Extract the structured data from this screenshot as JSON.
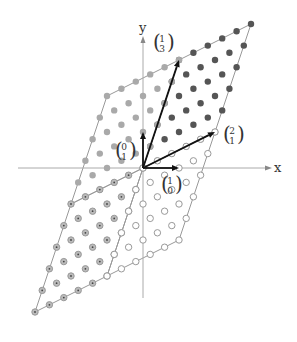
{
  "diagram": {
    "origin_px": [
      143,
      168
    ],
    "unit_px": 36,
    "axes": {
      "x_label": "x",
      "y_label": "y",
      "x_range_px": [
        18,
        268
      ],
      "y_range_px": [
        298,
        40
      ],
      "color": "#aaaaaa"
    },
    "vectors": [
      {
        "name": "e1",
        "to": [
          1,
          0
        ],
        "label_top": "1",
        "label_bottom": "0",
        "label_pos_px": [
          170,
          186
        ]
      },
      {
        "name": "e2",
        "to": [
          0,
          1
        ],
        "label_top": "0",
        "label_bottom": "1",
        "label_pos_px": [
          124,
          152
        ]
      },
      {
        "name": "v1",
        "to": [
          2,
          1
        ],
        "label_top": "2",
        "label_bottom": "1",
        "label_pos_px": [
          232,
          136
        ]
      },
      {
        "name": "v2",
        "to": [
          1,
          3
        ],
        "label_top": "1",
        "label_bottom": "3",
        "label_pos_px": [
          162,
          44
        ]
      }
    ],
    "vector_color": "#111111",
    "basis": [
      [
        2,
        1
      ],
      [
        1,
        3
      ]
    ],
    "subdivisions": 5,
    "parallelograms": [
      {
        "name": "fundamental-region",
        "offset": [
          0,
          0
        ],
        "style": "filled",
        "fill": "#555555",
        "stroke": "#555555",
        "edge_color": "#999999"
      },
      {
        "name": "shift-minus-v1",
        "offset": [
          -2,
          -1
        ],
        "style": "filled",
        "fill": "#a9a9a9",
        "stroke": "#a9a9a9",
        "edge_color": "#999999"
      },
      {
        "name": "shift-minus-v1-v2",
        "offset": [
          -3,
          -4
        ],
        "style": "ring-dot",
        "fill": "#bbbbbb",
        "stroke": "#999999",
        "edge_color": "#999999"
      },
      {
        "name": "shift-minus-v2",
        "offset": [
          -1,
          -3
        ],
        "style": "hollow",
        "fill": "#ffffff",
        "stroke": "#999999",
        "edge_color": "#999999"
      }
    ]
  }
}
